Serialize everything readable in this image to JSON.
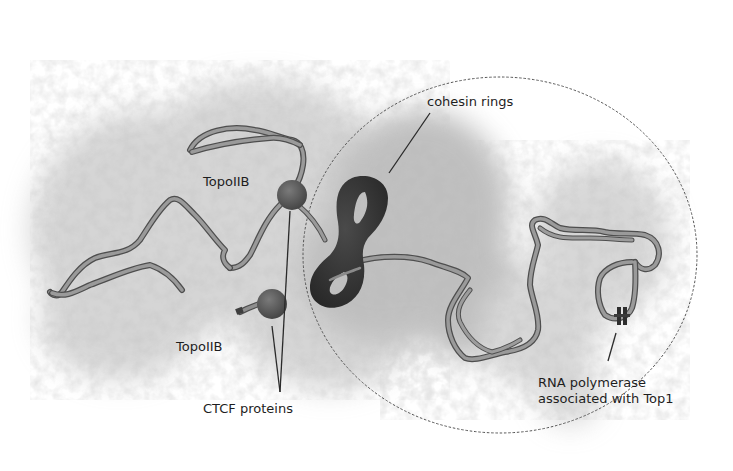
{
  "figure": {
    "colors": {
      "background": "#ffffff",
      "cloud": "#9a9a9a",
      "cloud_dense": "#6e6e6e",
      "strand_fill": "#8e8e8e",
      "strand_edge": "#555555",
      "cohesin": "#3a3a3a",
      "ctcf": "#5c5c5c",
      "leader_line": "#2a2a2a",
      "ellipse": "#555555"
    },
    "ellipse": {
      "cx": 500,
      "cy": 255,
      "rx": 197,
      "ry": 178,
      "style": "dashed"
    }
  },
  "labels": {
    "cohesin": {
      "text": "cohesin rings",
      "x": 427,
      "y": 94
    },
    "topo_top": {
      "text": "TopoIIB",
      "x": 203,
      "y": 174
    },
    "topo_bottom": {
      "text": "TopoIIB",
      "x": 176,
      "y": 339
    },
    "ctcf": {
      "text": "CTCF proteins",
      "x": 203,
      "y": 401
    },
    "rnapol": {
      "text": "RNA polymerase\nassociated with Top1",
      "x": 538,
      "y": 375
    }
  }
}
